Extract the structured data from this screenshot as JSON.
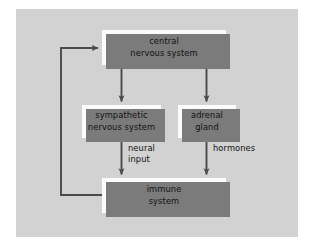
{
  "figure": {
    "background_color": "#ffffff",
    "panel_color": "#d2d2d2",
    "node_fill": "#fbfbfb",
    "shadow_color": "#7b7b7b",
    "connector_color": "#4a4a4a",
    "text_color": "#111111"
  },
  "nodes": [
    {
      "id": "cns",
      "label": "central\nnervous system"
    },
    {
      "id": "sns",
      "label": "sympathetic\nnervous system"
    },
    {
      "id": "adrenal",
      "label": "adrenal\ngland"
    },
    {
      "id": "immune",
      "label": "immune\nsystem"
    }
  ],
  "edges": [
    {
      "id": "cns-to-sns",
      "from": "cns",
      "to": "sns",
      "label": ""
    },
    {
      "id": "cns-to-adrenal",
      "from": "cns",
      "to": "adrenal",
      "label": ""
    },
    {
      "id": "sns-to-immune",
      "from": "sns",
      "to": "immune",
      "label": "neural\ninput"
    },
    {
      "id": "adrenal-to-immune",
      "from": "adrenal",
      "to": "immune",
      "label": "hormones"
    },
    {
      "id": "immune-to-cns",
      "from": "immune",
      "to": "cns",
      "label": ""
    }
  ],
  "edge_labels": {
    "neural_input": "neural\ninput",
    "hormones": "hormones"
  }
}
